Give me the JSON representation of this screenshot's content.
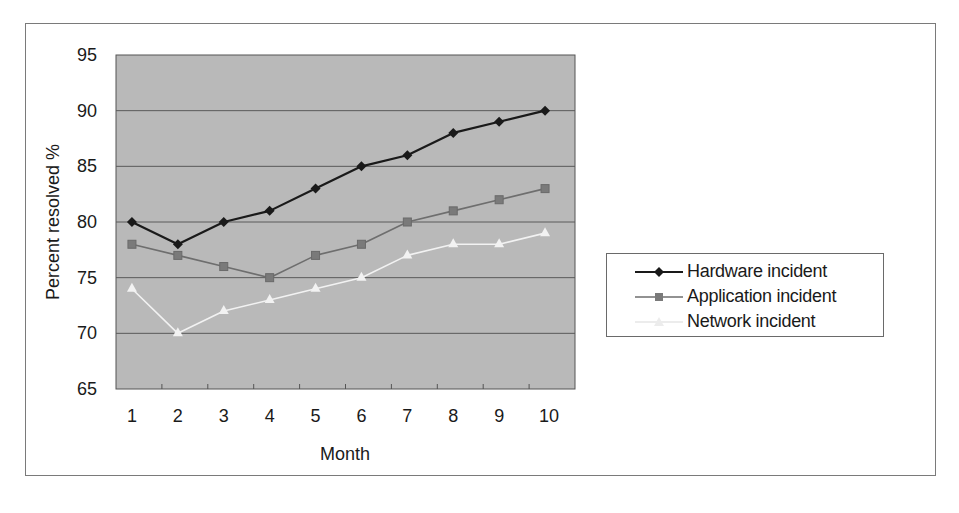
{
  "chart_data": {
    "type": "line",
    "title": "",
    "xlabel": "Month",
    "ylabel": "Percent resolved %",
    "x": [
      1,
      2,
      3,
      4,
      5,
      6,
      7,
      8,
      9,
      10
    ],
    "categories": [
      "1",
      "2",
      "3",
      "4",
      "5",
      "6",
      "7",
      "8",
      "9",
      "10"
    ],
    "ylim": [
      65,
      95
    ],
    "yticks": [
      65,
      70,
      75,
      80,
      85,
      90,
      95
    ],
    "grid": true,
    "legend_position": "right",
    "plot_background": "#b9b9b9",
    "series": [
      {
        "name": "Hardware incident",
        "marker": "diamond",
        "color": "#1a1a1a",
        "values": [
          80,
          78,
          80,
          81,
          83,
          85,
          86,
          88,
          89,
          90
        ]
      },
      {
        "name": "Application incident",
        "marker": "square",
        "color": "#6e6e6e",
        "values": [
          78,
          77,
          76,
          75,
          77,
          78,
          80,
          81,
          82,
          83
        ]
      },
      {
        "name": "Network incident",
        "marker": "triangle",
        "color": "#f2f2f2",
        "values": [
          74,
          70,
          72,
          73,
          74,
          75,
          77,
          78,
          78,
          79
        ]
      }
    ]
  },
  "labels": {
    "ylabel": "Percent resolved %",
    "xlabel": "Month",
    "legend": [
      "Hardware incident",
      "Application incident",
      "Network incident"
    ]
  }
}
